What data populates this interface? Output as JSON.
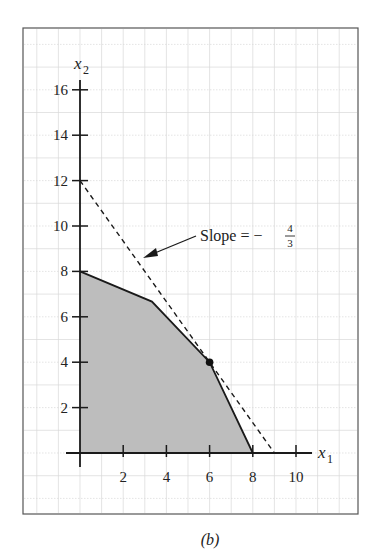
{
  "chart_data": {
    "type": "line",
    "title": "",
    "caption": "(b)",
    "xlabel": "x",
    "xlabel_sub": "1",
    "ylabel": "x",
    "ylabel_sub": "2",
    "xlim": [
      0,
      10
    ],
    "ylim": [
      0,
      16
    ],
    "x_ticks": [
      2,
      4,
      6,
      8,
      10
    ],
    "y_ticks": [
      2,
      4,
      6,
      8,
      10,
      12,
      14,
      16
    ],
    "grid": true,
    "feasible_region": {
      "name": "Feasible region (shaded)",
      "vertices": [
        [
          0,
          0
        ],
        [
          0,
          8
        ],
        [
          3.33,
          6.67
        ],
        [
          6,
          4
        ],
        [
          8,
          0
        ]
      ]
    },
    "objective_line": {
      "name": "Objective contour (dashed)",
      "points": [
        [
          0,
          12
        ],
        [
          9,
          0
        ]
      ],
      "slope": "-4/3"
    },
    "optimal_point": {
      "x": 6,
      "y": 4
    },
    "annotation": {
      "text": "Slope = −",
      "frac_num": "4",
      "frac_den": "3"
    }
  },
  "colors": {
    "fill": "#bdbdbd",
    "line": "#1a1a1a",
    "grid": "#d9d9d9",
    "frame": "#555555"
  }
}
